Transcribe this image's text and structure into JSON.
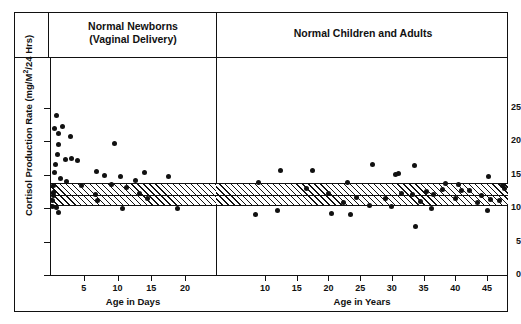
{
  "chart_data": {
    "type": "scatter",
    "title": "",
    "ylabel": "Cortisol Production Rate (mg/M2/24 Hrs)",
    "ylabel_parts": {
      "pre": "Cortisol Production Rate (mg/M",
      "sup": "2",
      "post": "/24 Hrs)"
    },
    "ylim": [
      0,
      28
    ],
    "yticks": [
      0,
      5,
      10,
      15,
      20,
      25
    ],
    "grid": false,
    "legend": "none",
    "normal_range_band": {
      "label": "normal range",
      "lower": 10.3,
      "upper": 13.7,
      "mean": 12.0,
      "fill": "hatched-45deg",
      "color": "#111111",
      "spans_both_panels": true
    },
    "panels": [
      {
        "name": "newborns",
        "title_line1": "Normal Newborns",
        "title_line2": "(Vaginal Delivery)",
        "xlabel": "Age in Days",
        "xlim": [
          0,
          24.5
        ],
        "xticks": [
          5,
          10,
          15,
          20
        ],
        "points": [
          {
            "x": 0.9,
            "y": 23.9
          },
          {
            "x": 0.7,
            "y": 22.0
          },
          {
            "x": 1.8,
            "y": 22.2
          },
          {
            "x": 1.2,
            "y": 21.2
          },
          {
            "x": 3.1,
            "y": 20.8
          },
          {
            "x": 1.3,
            "y": 19.5
          },
          {
            "x": 9.5,
            "y": 19.7
          },
          {
            "x": 1.1,
            "y": 18.1
          },
          {
            "x": 2.3,
            "y": 17.3
          },
          {
            "x": 3.2,
            "y": 17.4
          },
          {
            "x": 4.0,
            "y": 17.1
          },
          {
            "x": 0.8,
            "y": 16.6
          },
          {
            "x": 0.6,
            "y": 15.4
          },
          {
            "x": 6.9,
            "y": 15.5
          },
          {
            "x": 8.0,
            "y": 14.9
          },
          {
            "x": 14.0,
            "y": 15.4
          },
          {
            "x": 10.5,
            "y": 14.7
          },
          {
            "x": 17.5,
            "y": 14.8
          },
          {
            "x": 1.5,
            "y": 14.4
          },
          {
            "x": 2.4,
            "y": 14.0
          },
          {
            "x": 12.6,
            "y": 14.1
          },
          {
            "x": 0.5,
            "y": 13.4
          },
          {
            "x": 4.6,
            "y": 13.4
          },
          {
            "x": 9.1,
            "y": 13.5
          },
          {
            "x": 11.4,
            "y": 13.1
          },
          {
            "x": 0.5,
            "y": 12.3
          },
          {
            "x": 0.5,
            "y": 11.9
          },
          {
            "x": 6.8,
            "y": 12.1
          },
          {
            "x": 13.2,
            "y": 12.2
          },
          {
            "x": 0.4,
            "y": 11.1
          },
          {
            "x": 7.0,
            "y": 11.2
          },
          {
            "x": 14.4,
            "y": 11.4
          },
          {
            "x": 0.4,
            "y": 10.3
          },
          {
            "x": 1.0,
            "y": 10.1
          },
          {
            "x": 10.8,
            "y": 10.0
          },
          {
            "x": 18.9,
            "y": 10.0
          },
          {
            "x": 1.2,
            "y": 9.3
          }
        ]
      },
      {
        "name": "children_adults",
        "title": "Normal Children and Adults",
        "xlabel": "Age in Years",
        "xlim": [
          4,
          48
        ],
        "xticks": [
          10,
          15,
          20,
          25,
          30,
          35,
          40,
          45
        ],
        "points": [
          {
            "x": 27.0,
            "y": 16.6
          },
          {
            "x": 33.5,
            "y": 16.4
          },
          {
            "x": 12.5,
            "y": 15.6
          },
          {
            "x": 17.5,
            "y": 15.6
          },
          {
            "x": 31.0,
            "y": 15.2
          },
          {
            "x": 30.5,
            "y": 15.1
          },
          {
            "x": 45.3,
            "y": 14.7
          },
          {
            "x": 9.0,
            "y": 13.9
          },
          {
            "x": 23.0,
            "y": 13.8
          },
          {
            "x": 38.5,
            "y": 13.7
          },
          {
            "x": 40.5,
            "y": 13.5
          },
          {
            "x": 47.5,
            "y": 13.4
          },
          {
            "x": 47.8,
            "y": 12.9
          },
          {
            "x": 16.5,
            "y": 13.0
          },
          {
            "x": 38.0,
            "y": 12.8
          },
          {
            "x": 41.0,
            "y": 12.7
          },
          {
            "x": 42.2,
            "y": 12.6
          },
          {
            "x": 35.5,
            "y": 12.5
          },
          {
            "x": 20.0,
            "y": 12.2
          },
          {
            "x": 31.5,
            "y": 12.2
          },
          {
            "x": 33.2,
            "y": 12.0
          },
          {
            "x": 36.5,
            "y": 12.1
          },
          {
            "x": 44.2,
            "y": 11.9
          },
          {
            "x": 24.5,
            "y": 11.6
          },
          {
            "x": 29.0,
            "y": 11.4
          },
          {
            "x": 40.0,
            "y": 11.4
          },
          {
            "x": 45.5,
            "y": 11.3
          },
          {
            "x": 47.0,
            "y": 11.2
          },
          {
            "x": 22.3,
            "y": 10.8
          },
          {
            "x": 34.5,
            "y": 11.0
          },
          {
            "x": 43.5,
            "y": 10.9
          },
          {
            "x": 26.5,
            "y": 10.4
          },
          {
            "x": 30.0,
            "y": 10.2
          },
          {
            "x": 36.2,
            "y": 10.0
          },
          {
            "x": 45.0,
            "y": 9.7
          },
          {
            "x": 12.0,
            "y": 9.6
          },
          {
            "x": 20.5,
            "y": 9.2
          },
          {
            "x": 23.5,
            "y": 9.1
          },
          {
            "x": 8.5,
            "y": 9.1
          },
          {
            "x": 33.8,
            "y": 7.3
          }
        ]
      }
    ]
  }
}
